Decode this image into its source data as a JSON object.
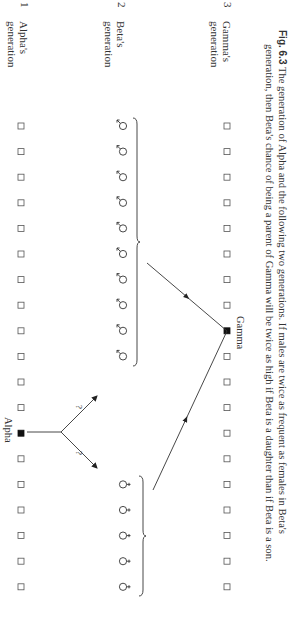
{
  "figure": {
    "orientation": "rotated-90-clockwise",
    "rows": [
      {
        "id": "alpha-generation",
        "label_line1": "Alpha's",
        "label_line2": "generation",
        "number": "1",
        "x": 21,
        "items": [
          "square",
          "square",
          "square",
          "square",
          "square",
          "square",
          "square",
          "square",
          "square",
          "square",
          "square",
          "square",
          "filled-square",
          "square",
          "square",
          "square",
          "square",
          "square",
          "square"
        ],
        "highlight_index": 12,
        "highlight_label": "Alpha"
      },
      {
        "id": "beta-generation",
        "label_line1": "Beta's",
        "label_line2": "generation",
        "number": "2",
        "x": 123,
        "males": {
          "count": 10,
          "start_index": 0,
          "symbol": "male"
        },
        "females": {
          "count": 5,
          "start_index": 14,
          "symbol": "female"
        }
      },
      {
        "id": "gamma-generation",
        "label_line1": "Gamma's",
        "label_line2": "generation",
        "number": "3",
        "x": 227,
        "items": [
          "square",
          "square",
          "square",
          "square",
          "square",
          "square",
          "square",
          "square",
          "filled-square",
          "square",
          "square",
          "square",
          "square",
          "square",
          "square",
          "square",
          "square",
          "square",
          "square"
        ],
        "highlight_index": 8,
        "highlight_label": "Gamma"
      }
    ],
    "spacing": {
      "first_y": 126,
      "step": 25.6
    },
    "alpha_branches": [
      {
        "label": "?",
        "direction": "up"
      },
      {
        "label": "?",
        "direction": "down"
      }
    ],
    "gamma_parents": [
      "males-group",
      "females-group"
    ]
  },
  "labels": {
    "alpha": "Alpha",
    "gamma": "Gamma",
    "row1_line1": "Alpha's",
    "row1_line2": "generation",
    "row1_num": "1",
    "row2_line1": "Beta's",
    "row2_line2": "generation",
    "row2_num": "2",
    "row3_line1": "Gamma's",
    "row3_line2": "generation",
    "row3_num": "3",
    "q1": "?",
    "q2": "?"
  },
  "caption": {
    "fig_label": "Fig. 6.3",
    "line1": " The generation of Alpha and the following two generations. If males are twice as frequent as females in Beta's",
    "line2": "generation, then Beta's chance of being a parent of Gamma will be twice as high if Beta is a daughter than if Beta is a son."
  }
}
